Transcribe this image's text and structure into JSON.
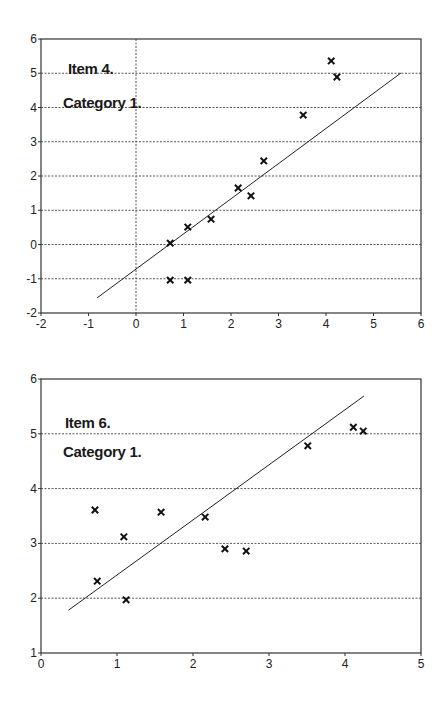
{
  "chart_data": [
    {
      "type": "scatter",
      "title": "",
      "annotations": [
        "Item 4.",
        "Category 1."
      ],
      "xlabel": "",
      "ylabel": "",
      "xlim": [
        -2,
        6
      ],
      "ylim": [
        -2,
        6
      ],
      "xticks": [
        -2,
        -1,
        0,
        1,
        2,
        3,
        4,
        5,
        6
      ],
      "yticks": [
        -2,
        -1,
        0,
        1,
        2,
        3,
        4,
        5,
        6
      ],
      "xtick_labels": [
        "-2",
        "-1",
        "0",
        "1",
        "2",
        "3",
        "4",
        "5",
        "6"
      ],
      "ytick_labels": [
        "-2",
        "-1",
        "0",
        "1",
        "2",
        "3",
        "4",
        "5",
        "6"
      ],
      "grid": {
        "horizontal": true,
        "style": "dotted",
        "vertical_at_x0": true
      },
      "legend": null,
      "marker": "x",
      "series": [
        {
          "name": "observations",
          "points": [
            [
              0.72,
              0.04
            ],
            [
              1.09,
              0.51
            ],
            [
              1.58,
              0.74
            ],
            [
              2.15,
              1.65
            ],
            [
              2.42,
              1.42
            ],
            [
              2.69,
              2.44
            ],
            [
              0.72,
              -1.04
            ],
            [
              1.09,
              -1.04
            ],
            [
              3.52,
              3.78
            ],
            [
              4.11,
              5.36
            ],
            [
              4.23,
              4.89
            ]
          ]
        }
      ],
      "fit_line": {
        "from": [
          -0.82,
          -1.56
        ],
        "to": [
          5.58,
          5.01
        ]
      }
    },
    {
      "type": "scatter",
      "title": "",
      "annotations": [
        "Item  6.",
        "Category 1."
      ],
      "xlabel": "",
      "ylabel": "",
      "xlim": [
        0,
        5
      ],
      "ylim": [
        1,
        6
      ],
      "xticks": [
        0,
        1,
        2,
        3,
        4,
        5
      ],
      "yticks": [
        1,
        2,
        3,
        4,
        5,
        6
      ],
      "xtick_labels": [
        "0",
        "1",
        "2",
        "3",
        "4",
        "5"
      ],
      "ytick_labels": [
        "1",
        "2",
        "3",
        "4",
        "5",
        "6"
      ],
      "grid": {
        "horizontal": true,
        "style": "dotted"
      },
      "legend": null,
      "marker": "x",
      "series": [
        {
          "name": "observations",
          "points": [
            [
              0.71,
              3.61
            ],
            [
              0.74,
              2.31
            ],
            [
              1.09,
              3.12
            ],
            [
              1.12,
              1.97
            ],
            [
              1.58,
              3.57
            ],
            [
              2.16,
              3.48
            ],
            [
              2.42,
              2.9
            ],
            [
              2.7,
              2.86
            ],
            [
              3.51,
              4.78
            ],
            [
              4.11,
              5.12
            ],
            [
              4.24,
              5.05
            ]
          ]
        }
      ],
      "fit_line": {
        "from": [
          0.36,
          1.78
        ],
        "to": [
          4.25,
          5.69
        ]
      }
    }
  ]
}
